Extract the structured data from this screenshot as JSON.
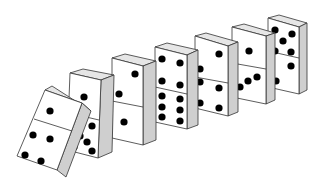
{
  "scene": {
    "description": "Row of seven dominoes falling in sequence, first domino tipping into the second",
    "background": "#ffffff",
    "colors": {
      "face": "#ffffff",
      "side": "#cfcfcf",
      "top": "#e6e6e6",
      "outline": "#333333",
      "pip": "#000000"
    }
  },
  "dominoes": [
    {
      "id": 1,
      "state": "falling",
      "face": [
        [
          45,
          90
        ],
        [
          82,
          103
        ],
        [
          57,
          170
        ],
        [
          17,
          156
        ]
      ],
      "side": [
        [
          82,
          103
        ],
        [
          91,
          111
        ],
        [
          66,
          177
        ],
        [
          57,
          170
        ]
      ],
      "top": [
        [
          45,
          90
        ],
        [
          52,
          86
        ],
        [
          91,
          111
        ],
        [
          82,
          103
        ]
      ],
      "divider": [
        [
          34,
          119
        ],
        [
          72,
          131
        ]
      ],
      "pips": [
        [
          50,
          111
        ],
        [
          33,
          135
        ],
        [
          50,
          139
        ],
        [
          25,
          155
        ],
        [
          41,
          161
        ]
      ]
    },
    {
      "id": 2,
      "state": "leaning",
      "face": [
        [
          70,
          73
        ],
        [
          101,
          80
        ],
        [
          98,
          158
        ],
        [
          67,
          150
        ]
      ],
      "side": [
        [
          101,
          80
        ],
        [
          114,
          75
        ],
        [
          112,
          152
        ],
        [
          98,
          158
        ]
      ],
      "top": [
        [
          70,
          73
        ],
        [
          83,
          69
        ],
        [
          114,
          75
        ],
        [
          101,
          80
        ]
      ],
      "divider": [
        [
          69,
          113
        ],
        [
          99,
          120
        ]
      ],
      "pips": [
        [
          84,
          97
        ],
        [
          80,
          136
        ],
        [
          92,
          126
        ],
        [
          87,
          142
        ],
        [
          74,
          147
        ],
        [
          92,
          151
        ]
      ]
    },
    {
      "id": 3,
      "state": "standing",
      "face": [
        [
          112,
          58
        ],
        [
          143,
          66
        ],
        [
          143,
          145
        ],
        [
          112,
          138
        ]
      ],
      "side": [
        [
          143,
          66
        ],
        [
          156,
          61
        ],
        [
          156,
          140
        ],
        [
          143,
          145
        ]
      ],
      "top": [
        [
          112,
          58
        ],
        [
          125,
          54
        ],
        [
          156,
          61
        ],
        [
          143,
          66
        ]
      ],
      "divider": [
        [
          112,
          101
        ],
        [
          143,
          107
        ]
      ],
      "pips": [
        [
          135,
          74
        ],
        [
          119,
          94
        ],
        [
          124,
          122
        ]
      ]
    },
    {
      "id": 4,
      "state": "standing",
      "face": [
        [
          155,
          47
        ],
        [
          187,
          55
        ],
        [
          187,
          129
        ],
        [
          155,
          122
        ]
      ],
      "side": [
        [
          187,
          55
        ],
        [
          198,
          50
        ],
        [
          198,
          125
        ],
        [
          187,
          129
        ]
      ],
      "top": [
        [
          155,
          47
        ],
        [
          167,
          43
        ],
        [
          198,
          50
        ],
        [
          187,
          55
        ]
      ],
      "divider": [
        [
          155,
          87
        ],
        [
          187,
          94
        ]
      ],
      "pips": [
        [
          162,
          59
        ],
        [
          180,
          63
        ],
        [
          162,
          81
        ],
        [
          180,
          85
        ],
        [
          162,
          96
        ],
        [
          180,
          99
        ],
        [
          162,
          107
        ],
        [
          180,
          110
        ],
        [
          162,
          117
        ],
        [
          180,
          121
        ]
      ]
    },
    {
      "id": 5,
      "state": "standing",
      "face": [
        [
          195,
          36
        ],
        [
          228,
          46
        ],
        [
          228,
          116
        ],
        [
          195,
          108
        ]
      ],
      "side": [
        [
          228,
          46
        ],
        [
          238,
          42
        ],
        [
          238,
          112
        ],
        [
          228,
          116
        ]
      ],
      "top": [
        [
          195,
          36
        ],
        [
          206,
          33
        ],
        [
          238,
          42
        ],
        [
          228,
          46
        ]
      ],
      "divider": [
        [
          195,
          77
        ],
        [
          228,
          83
        ]
      ],
      "pips": [
        [
          219,
          54
        ],
        [
          200,
          69
        ],
        [
          200,
          82
        ],
        [
          219,
          88
        ],
        [
          200,
          103
        ],
        [
          219,
          108
        ]
      ]
    },
    {
      "id": 6,
      "state": "standing",
      "face": [
        [
          232,
          27
        ],
        [
          266,
          36
        ],
        [
          266,
          104
        ],
        [
          232,
          97
        ]
      ],
      "side": [
        [
          266,
          36
        ],
        [
          275,
          33
        ],
        [
          275,
          100
        ],
        [
          266,
          104
        ]
      ],
      "top": [
        [
          232,
          27
        ],
        [
          244,
          24
        ],
        [
          275,
          33
        ],
        [
          266,
          36
        ]
      ],
      "divider": [
        [
          232,
          63
        ],
        [
          266,
          69
        ]
      ],
      "pips": [
        [
          249,
          51
        ],
        [
          240,
          87
        ],
        [
          248,
          81
        ],
        [
          257,
          77
        ]
      ]
    },
    {
      "id": 7,
      "state": "standing",
      "face": [
        [
          268,
          18
        ],
        [
          299,
          27
        ],
        [
          299,
          94
        ],
        [
          268,
          87
        ]
      ],
      "side": [
        [
          299,
          27
        ],
        [
          307,
          23
        ],
        [
          307,
          90
        ],
        [
          299,
          94
        ]
      ],
      "top": [
        [
          268,
          18
        ],
        [
          279,
          15
        ],
        [
          307,
          23
        ],
        [
          299,
          27
        ]
      ],
      "divider": [
        [
          268,
          51
        ],
        [
          299,
          58
        ]
      ],
      "pips": [
        [
          275,
          30
        ],
        [
          292,
          34
        ],
        [
          283,
          41
        ],
        [
          275,
          51
        ],
        [
          291,
          52
        ],
        [
          291,
          66
        ],
        [
          276,
          81
        ]
      ]
    }
  ]
}
